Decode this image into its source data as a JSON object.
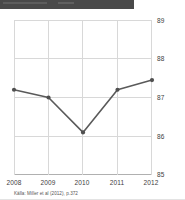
{
  "header": {
    "bar_color": "#4a4a4a"
  },
  "chart_data": {
    "type": "line",
    "title": "",
    "subtitle": "",
    "xlabel": "",
    "ylabel": "",
    "categories": [
      "2008",
      "2009",
      "2010",
      "2011",
      "2012"
    ],
    "x": [
      2008,
      2009,
      2010,
      2011,
      2012
    ],
    "values": [
      87.2,
      87.0,
      86.1,
      87.2,
      87.45
    ],
    "series": [
      {
        "name": "value",
        "values": [
          87.2,
          87.0,
          86.1,
          87.2,
          87.45
        ]
      }
    ],
    "ylim": [
      85,
      89
    ],
    "yticks": [
      89,
      88,
      87,
      86,
      85
    ],
    "ytick_labels": [
      "89",
      "88",
      "87",
      "86",
      "85"
    ],
    "xtick_labels": [
      "2008",
      "2009",
      "2010",
      "2011",
      "2012"
    ],
    "grid": true,
    "grid_color": "#d8d8d8",
    "legend": false,
    "legend_position": "none",
    "y_axis_side": "right",
    "line_color": "#5a5a5a",
    "marker_color": "#4f4f4f",
    "marker_shape": "circle",
    "annotations": []
  },
  "caption": {
    "source_text": "Källa: Miller et al (2012), p.372"
  }
}
